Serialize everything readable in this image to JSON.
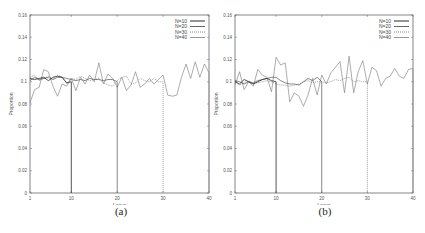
{
  "figure": {
    "panels": [
      {
        "id": "a",
        "caption": "(a)"
      },
      {
        "id": "b",
        "caption": "(b)"
      }
    ]
  },
  "chart_data": [
    {
      "type": "line",
      "title": "",
      "caption": "(a)",
      "xlabel": "Locus",
      "ylabel": "Proportion",
      "xlim": [
        1,
        40
      ],
      "ylim": [
        0,
        0.16
      ],
      "xticks": [
        1,
        10,
        20,
        30,
        40
      ],
      "yticks": [
        0,
        0.02,
        0.04,
        0.06,
        0.08,
        0.1,
        0.12,
        0.14,
        0.16
      ],
      "ytick_labels": [
        "0",
        "0.02",
        "0.04",
        "0.06",
        "0.08",
        "0.1",
        "0.12",
        "0.14",
        "0.16"
      ],
      "grid": false,
      "legend_position": "upper right",
      "series": [
        {
          "name": "N=10",
          "style": "solid-dark",
          "x": [
            1,
            2,
            3,
            4,
            5,
            6,
            7,
            8,
            9,
            10,
            10
          ],
          "values": [
            0.103,
            0.102,
            0.103,
            0.104,
            0.101,
            0.104,
            0.105,
            0.104,
            0.099,
            0.1,
            0
          ]
        },
        {
          "name": "N=20",
          "style": "solid-mid",
          "x": [
            1,
            2,
            3,
            4,
            5,
            6,
            7,
            8,
            9,
            10,
            11,
            12,
            13,
            14,
            15,
            16,
            17,
            18,
            19,
            20,
            20
          ],
          "values": [
            0.101,
            0.104,
            0.102,
            0.103,
            0.104,
            0.102,
            0.104,
            0.104,
            0.103,
            0.102,
            0.101,
            0.102,
            0.101,
            0.103,
            0.102,
            0.102,
            0.101,
            0.102,
            0.102,
            0.1,
            0
          ]
        },
        {
          "name": "N=30",
          "style": "dotted",
          "x": [
            1,
            2,
            3,
            4,
            5,
            6,
            7,
            8,
            9,
            10,
            11,
            12,
            13,
            14,
            15,
            16,
            17,
            18,
            19,
            20,
            21,
            22,
            23,
            24,
            25,
            26,
            27,
            28,
            29,
            30,
            30
          ],
          "values": [
            0.104,
            0.106,
            0.101,
            0.103,
            0.105,
            0.102,
            0.106,
            0.104,
            0.098,
            0.103,
            0.102,
            0.105,
            0.103,
            0.101,
            0.102,
            0.103,
            0.099,
            0.097,
            0.096,
            0.101,
            0.104,
            0.105,
            0.098,
            0.099,
            0.103,
            0.101,
            0.1,
            0.103,
            0.1,
            0.1,
            0
          ]
        },
        {
          "name": "N=40",
          "style": "solid-light",
          "x": [
            1,
            2,
            3,
            4,
            5,
            6,
            7,
            8,
            9,
            10,
            11,
            12,
            13,
            14,
            15,
            16,
            17,
            18,
            19,
            20,
            21,
            22,
            23,
            24,
            25,
            26,
            27,
            28,
            29,
            30,
            31,
            32,
            33,
            34,
            35,
            36,
            37,
            38,
            39,
            40,
            40
          ],
          "values": [
            0.081,
            0.093,
            0.095,
            0.111,
            0.109,
            0.096,
            0.087,
            0.098,
            0.096,
            0.103,
            0.092,
            0.104,
            0.098,
            0.106,
            0.1,
            0.117,
            0.098,
            0.107,
            0.103,
            0.095,
            0.104,
            0.092,
            0.097,
            0.109,
            0.095,
            0.098,
            0.103,
            0.098,
            0.102,
            0.106,
            0.088,
            0.087,
            0.088,
            0.104,
            0.116,
            0.103,
            0.118,
            0.104,
            0.116,
            0.108,
            0
          ]
        }
      ]
    },
    {
      "type": "line",
      "title": "",
      "caption": "(b)",
      "xlabel": "Locus",
      "ylabel": "Proportion",
      "xlim": [
        1,
        40
      ],
      "ylim": [
        0,
        0.16
      ],
      "xticks": [
        1,
        10,
        20,
        30,
        40
      ],
      "yticks": [
        0,
        0.02,
        0.04,
        0.06,
        0.08,
        0.1,
        0.12,
        0.14,
        0.16
      ],
      "ytick_labels": [
        "0",
        "0.02",
        "0.04",
        "0.06",
        "0.08",
        "0.1",
        "0.12",
        "0.14",
        "0.16"
      ],
      "grid": false,
      "legend_position": "upper right",
      "series": [
        {
          "name": "N=10",
          "style": "solid-dark",
          "x": [
            1,
            2,
            3,
            4,
            5,
            6,
            7,
            8,
            9,
            10,
            10
          ],
          "values": [
            0.1,
            0.098,
            0.102,
            0.1,
            0.098,
            0.1,
            0.102,
            0.103,
            0.101,
            0.1,
            0
          ]
        },
        {
          "name": "N=20",
          "style": "solid-mid",
          "x": [
            1,
            2,
            3,
            4,
            5,
            6,
            7,
            8,
            9,
            10,
            11,
            12,
            13,
            14,
            15,
            16,
            17,
            18,
            19,
            20,
            20
          ],
          "values": [
            0.101,
            0.1,
            0.098,
            0.1,
            0.099,
            0.101,
            0.102,
            0.103,
            0.104,
            0.104,
            0.101,
            0.099,
            0.098,
            0.098,
            0.097,
            0.1,
            0.103,
            0.101,
            0.104,
            0.1,
            0
          ]
        },
        {
          "name": "N=30",
          "style": "dotted",
          "x": [
            1,
            2,
            3,
            4,
            5,
            6,
            7,
            8,
            9,
            10,
            11,
            12,
            13,
            14,
            15,
            16,
            17,
            18,
            19,
            20,
            21,
            22,
            23,
            24,
            25,
            26,
            27,
            28,
            29,
            30,
            30
          ],
          "values": [
            0.1,
            0.097,
            0.099,
            0.101,
            0.098,
            0.099,
            0.1,
            0.101,
            0.1,
            0.098,
            0.097,
            0.097,
            0.096,
            0.097,
            0.098,
            0.1,
            0.101,
            0.099,
            0.1,
            0.1,
            0.099,
            0.1,
            0.102,
            0.101,
            0.103,
            0.104,
            0.1,
            0.101,
            0.1,
            0.1,
            0
          ]
        },
        {
          "name": "N=40",
          "style": "solid-light",
          "x": [
            1,
            2,
            3,
            4,
            5,
            6,
            7,
            8,
            9,
            10,
            11,
            12,
            13,
            14,
            15,
            16,
            17,
            18,
            19,
            20,
            21,
            22,
            23,
            24,
            25,
            26,
            27,
            28,
            29,
            30,
            31,
            32,
            33,
            34,
            35,
            36,
            37,
            38,
            39,
            40,
            40
          ],
          "values": [
            0.097,
            0.109,
            0.093,
            0.1,
            0.096,
            0.111,
            0.106,
            0.104,
            0.091,
            0.122,
            0.115,
            0.117,
            0.082,
            0.09,
            0.087,
            0.078,
            0.088,
            0.103,
            0.088,
            0.106,
            0.098,
            0.108,
            0.113,
            0.118,
            0.09,
            0.123,
            0.09,
            0.109,
            0.119,
            0.098,
            0.113,
            0.11,
            0.096,
            0.103,
            0.105,
            0.112,
            0.105,
            0.103,
            0.111,
            0.112,
            0
          ]
        }
      ]
    }
  ],
  "styles": {
    "solid-dark": {
      "color": "#2a2a2a",
      "dash": "",
      "width": 0.8
    },
    "solid-mid": {
      "color": "#555555",
      "dash": "",
      "width": 0.7
    },
    "dotted": {
      "color": "#777777",
      "dash": "1,1",
      "width": 0.7
    },
    "solid-light": {
      "color": "#8a8a8a",
      "dash": "",
      "width": 0.7
    }
  },
  "layout": {
    "panel_a": {
      "left": 30,
      "top": 15,
      "right": 209,
      "bottom": 193
    },
    "panel_b": {
      "left": 23,
      "top": 15,
      "right": 201,
      "bottom": 193
    }
  }
}
